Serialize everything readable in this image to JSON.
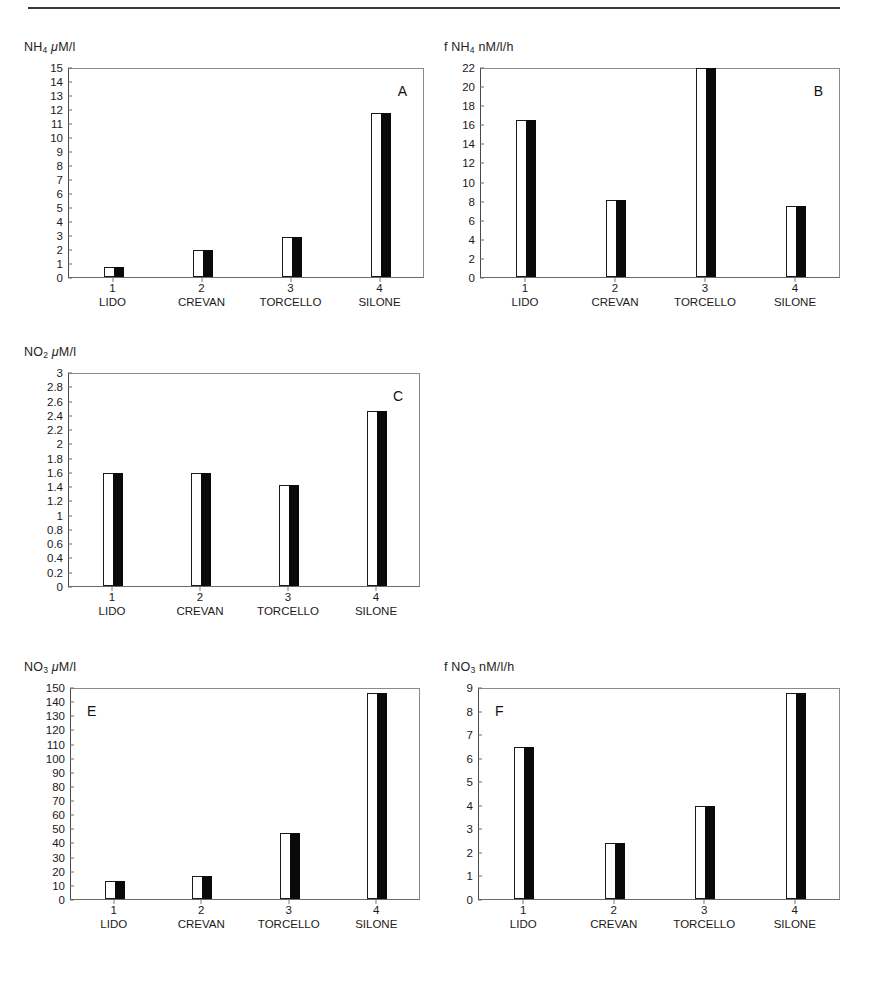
{
  "figure": {
    "top_rule": true,
    "category_numbers": [
      "1",
      "2",
      "3",
      "4"
    ],
    "category_names": [
      "LIDO",
      "CREVAN",
      "TORCELLO",
      "SILONE"
    ],
    "bar_style": {
      "left_half": "white-outlined",
      "right_half": "black-filled",
      "outline_color": "#1a1a1a",
      "fill_color": "#0a0a0a"
    }
  },
  "panels": [
    {
      "id": "A",
      "letter": "A",
      "letter_position": "top-right",
      "title_html": "NH<sub>4</sub> <span class=\"ital\">μ</span>M/l",
      "title_text": "NH4 μM/l",
      "position": "top-left"
    },
    {
      "id": "B",
      "letter": "B",
      "letter_position": "top-right",
      "title_html": "f NH<sub>4</sub> nM/l/h",
      "title_text": "f NH4 nM/l/h",
      "position": "top-right"
    },
    {
      "id": "C",
      "letter": "C",
      "letter_position": "top-right",
      "title_html": "NO<sub>2</sub> <span class=\"ital\">μ</span>M/l",
      "title_text": "NO2 μM/l",
      "position": "middle-left"
    },
    {
      "id": "E",
      "letter": "E",
      "letter_position": "top-left",
      "title_html": "NO<sub>3</sub> <span class=\"ital\">μ</span>M/l",
      "title_text": "NO3 μM/l",
      "position": "bottom-left"
    },
    {
      "id": "F",
      "letter": "F",
      "letter_position": "top-left",
      "title_html": "f NO<sub>3</sub> nM/l/h",
      "title_text": "f NO3 nM/l/h",
      "position": "bottom-right"
    }
  ],
  "chart_data": [
    {
      "panel": "A",
      "type": "bar",
      "title": "NH4 μM/l",
      "xlabel": "",
      "ylabel": "NH4 μM/l",
      "categories": [
        "LIDO",
        "CREVAN",
        "TORCELLO",
        "SILONE"
      ],
      "category_numbers": [
        "1",
        "2",
        "3",
        "4"
      ],
      "values": [
        0.7,
        1.9,
        2.85,
        11.7
      ],
      "ylim": [
        0,
        15
      ],
      "ytick_step": 1,
      "yticks": [
        0,
        1,
        2,
        3,
        4,
        5,
        6,
        7,
        8,
        9,
        10,
        11,
        12,
        13,
        14,
        15
      ],
      "grid": false,
      "legend": "none",
      "annotation": "A"
    },
    {
      "panel": "B",
      "type": "bar",
      "title": "f NH4 nM/l/h",
      "xlabel": "",
      "ylabel": "f NH4 nM/l/h",
      "categories": [
        "LIDO",
        "CREVAN",
        "TORCELLO",
        "SILONE"
      ],
      "category_numbers": [
        "1",
        "2",
        "3",
        "4"
      ],
      "values": [
        16.5,
        8.1,
        21.9,
        7.4
      ],
      "ylim": [
        0,
        22
      ],
      "ytick_step": 2,
      "yticks": [
        0,
        2,
        4,
        6,
        8,
        10,
        12,
        14,
        16,
        18,
        20,
        22
      ],
      "grid": false,
      "legend": "none",
      "annotation": "B"
    },
    {
      "panel": "C",
      "type": "bar",
      "title": "NO2 μM/l",
      "xlabel": "",
      "ylabel": "NO2 μM/l",
      "categories": [
        "LIDO",
        "CREVAN",
        "TORCELLO",
        "SILONE"
      ],
      "category_numbers": [
        "1",
        "2",
        "3",
        "4"
      ],
      "values": [
        1.59,
        1.59,
        1.42,
        2.45
      ],
      "ylim": [
        0,
        3
      ],
      "ytick_step": 0.2,
      "yticks": [
        0,
        0.2,
        0.4,
        0.6,
        0.8,
        1,
        1.2,
        1.4,
        1.6,
        1.8,
        2,
        2.2,
        2.4,
        2.6,
        2.8,
        3
      ],
      "grid": false,
      "legend": "none",
      "annotation": "C"
    },
    {
      "panel": "E",
      "type": "bar",
      "title": "NO3 μM/l",
      "xlabel": "",
      "ylabel": "NO3 μM/l",
      "categories": [
        "LIDO",
        "CREVAN",
        "TORCELLO",
        "SILONE"
      ],
      "category_numbers": [
        "1",
        "2",
        "3",
        "4"
      ],
      "values": [
        12.5,
        16.5,
        47,
        145.5
      ],
      "ylim": [
        0,
        150
      ],
      "ytick_step": 10,
      "yticks": [
        0,
        10,
        20,
        30,
        40,
        50,
        60,
        70,
        80,
        90,
        100,
        110,
        120,
        130,
        140,
        150
      ],
      "grid": false,
      "legend": "none",
      "annotation": "E"
    },
    {
      "panel": "F",
      "type": "bar",
      "title": "f NO3 nM/l/h",
      "xlabel": "",
      "ylabel": "f NO3 nM/l/h",
      "categories": [
        "LIDO",
        "CREVAN",
        "TORCELLO",
        "SILONE"
      ],
      "category_numbers": [
        "1",
        "2",
        "3",
        "4"
      ],
      "values": [
        6.45,
        2.37,
        3.95,
        8.75
      ],
      "ylim": [
        0,
        9
      ],
      "ytick_step": 1,
      "yticks": [
        0,
        1,
        2,
        3,
        4,
        5,
        6,
        7,
        8,
        9
      ],
      "grid": false,
      "legend": "none",
      "annotation": "F"
    }
  ]
}
